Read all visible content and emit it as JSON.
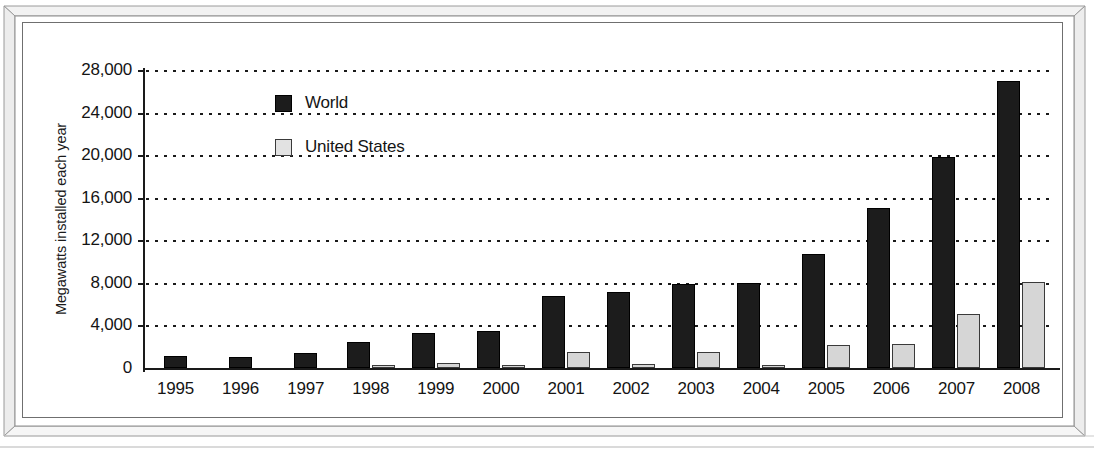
{
  "chart_data": {
    "type": "bar",
    "title": "",
    "xlabel": "",
    "ylabel": "Megawatts installed each year",
    "categories": [
      "1995",
      "1996",
      "1997",
      "1998",
      "1999",
      "2000",
      "2001",
      "2002",
      "2003",
      "2004",
      "2005",
      "2006",
      "2007",
      "2008"
    ],
    "series": [
      {
        "name": "World",
        "color": "#1c1c1c",
        "values": [
          1100,
          1000,
          1400,
          2400,
          3300,
          3500,
          6800,
          7100,
          7900,
          8000,
          10700,
          15000,
          19800,
          27000
        ]
      },
      {
        "name": "United States",
        "color": "#d6d6d6",
        "values": [
          0,
          0,
          0,
          150,
          500,
          100,
          1500,
          400,
          1500,
          300,
          2200,
          2300,
          5100,
          8100
        ]
      }
    ],
    "ylim": [
      0,
      28000
    ],
    "yticks": [
      0,
      4000,
      8000,
      12000,
      16000,
      20000,
      24000,
      28000
    ],
    "ytick_labels": [
      "0",
      "4,000",
      "8,000",
      "12,000",
      "16,000",
      "20,000",
      "24,000",
      "28,000"
    ],
    "grid": "horizontal-dotted",
    "legend_position": "top-left-inside",
    "legend_entries": [
      "World",
      "United States"
    ]
  },
  "frame": {
    "style": "beveled-3d-box",
    "border_color": "#8e8e8e",
    "inner_border_color": "#6f6f6f"
  }
}
